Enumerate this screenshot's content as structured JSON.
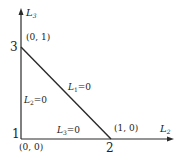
{
  "diagram": {
    "type": "triangle-region-plot",
    "axes": {
      "vertical": {
        "label": "L",
        "subscript": "3"
      },
      "horizontal": {
        "label": "L",
        "subscript": "2"
      }
    },
    "vertices": [
      {
        "number": "3",
        "coord": "(0, 1)"
      },
      {
        "number": "1",
        "coord": "(0, 0)"
      },
      {
        "number": "2",
        "coord": "(1, 0)"
      }
    ],
    "edges": [
      {
        "var": "L",
        "sub": "1",
        "eq": "=0",
        "position": "diagonal"
      },
      {
        "var": "L",
        "sub": "2",
        "eq": "=0",
        "position": "left"
      },
      {
        "var": "L",
        "sub": "3",
        "eq": "=0",
        "position": "bottom"
      }
    ],
    "colors": {
      "line": "#2a2a2a",
      "text": "#222222",
      "background": "#ffffff"
    }
  }
}
